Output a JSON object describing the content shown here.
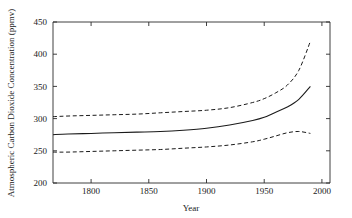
{
  "figure": {
    "background_color": "#ffffff",
    "line_color": "#1a1a1a"
  },
  "chart_data": {
    "type": "line",
    "title": "",
    "subtitle": "",
    "xlabel": "Year",
    "ylabel": "Atmospheric Carbon Dioxide Concentration (ppmv)",
    "xlim": [
      1767,
      2007
    ],
    "ylim": [
      200,
      450
    ],
    "xticks": [
      1800,
      1850,
      1900,
      1950,
      2000
    ],
    "xtick_labels": [
      "1800",
      "1850",
      "1900",
      "1950",
      "2000"
    ],
    "yticks": [
      200,
      250,
      300,
      350,
      400,
      450
    ],
    "ytick_labels": [
      "200",
      "250",
      "300",
      "350",
      "400",
      "450"
    ],
    "grid": false,
    "legend": null,
    "legend_position": "none",
    "annotations": [],
    "x": [
      1767,
      1780,
      1800,
      1820,
      1840,
      1860,
      1880,
      1900,
      1920,
      1940,
      1950,
      1960,
      1970,
      1980,
      1990
    ],
    "series": [
      {
        "name": "Upper bound",
        "style": "dashed",
        "color": "#1a1a1a",
        "values": [
          303,
          304,
          305,
          306,
          307,
          309,
          311,
          313,
          317,
          325,
          331,
          340,
          352,
          375,
          420
        ]
      },
      {
        "name": "Mean estimate",
        "style": "solid",
        "color": "#1a1a1a",
        "values": [
          275,
          276,
          277,
          278,
          279,
          280,
          282,
          285,
          290,
          297,
          302,
          310,
          318,
          330,
          350
        ]
      },
      {
        "name": "Lower bound",
        "style": "dashed",
        "color": "#1a1a1a",
        "values": [
          248,
          248,
          249,
          250,
          251,
          252,
          254,
          256,
          259,
          264,
          268,
          273,
          278,
          280,
          277
        ]
      }
    ]
  }
}
